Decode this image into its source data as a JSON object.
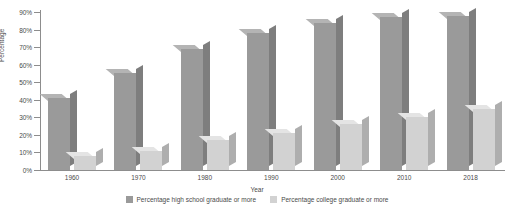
{
  "chart_data": {
    "type": "bar",
    "title": "",
    "xlabel": "Year",
    "ylabel": "Percentage",
    "categories": [
      "1960",
      "1970",
      "1980",
      "1990",
      "2000",
      "2010",
      "2018"
    ],
    "series": [
      {
        "name": "Percentage high school graduate or more",
        "color": "#9a9a9a",
        "values": [
          41,
          55,
          69,
          78,
          84,
          87,
          88
        ]
      },
      {
        "name": "Percentage college graduate or more",
        "color": "#d2d2d2",
        "values": [
          8,
          11,
          17,
          21,
          26,
          30,
          35
        ]
      }
    ],
    "ylim": [
      0,
      90
    ],
    "ytick_values": [
      0,
      10,
      20,
      30,
      40,
      50,
      60,
      70,
      80,
      90
    ],
    "ytick_labels": [
      "0%",
      "10%",
      "20%",
      "30%",
      "40%",
      "50%",
      "60%",
      "70%",
      "80%",
      "90%"
    ],
    "grid": false,
    "legend_position": "bottom",
    "style": "3d-column"
  },
  "legend": {
    "items": [
      {
        "label": "Percentage high school graduate or more"
      },
      {
        "label": "Percentage college graduate or more"
      }
    ]
  }
}
